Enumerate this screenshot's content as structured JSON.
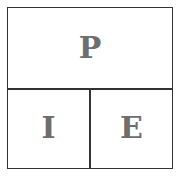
{
  "diagram": {
    "top": {
      "label": "P"
    },
    "bottom_left": {
      "label": "I"
    },
    "bottom_right": {
      "label": "E"
    },
    "colors": {
      "border": "#333333",
      "text": "#6e6e6e",
      "background": "#ffffff"
    }
  }
}
